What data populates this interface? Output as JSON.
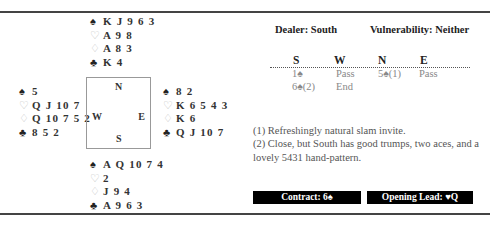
{
  "hands": {
    "north": {
      "spades": "K J 9 6 3",
      "hearts": "A 9 8",
      "diamonds": "A 8 3",
      "clubs": "K 4"
    },
    "west": {
      "spades": "5",
      "hearts": "Q J 10 7",
      "diamonds": "Q 10 7 5 2",
      "clubs": "8 5 2"
    },
    "east": {
      "spades": "8 2",
      "hearts": "K 6 5 4 3",
      "diamonds": "K 6",
      "clubs": "Q J 10 7"
    },
    "south": {
      "spades": "A Q 10 7 4",
      "hearts": "2",
      "diamonds": "J 9 4",
      "clubs": "A 9 6 3"
    }
  },
  "suit_symbols": {
    "spades": "♠",
    "hearts": "♡",
    "diamonds": "♢",
    "clubs": "♣"
  },
  "compass": {
    "n": "N",
    "w": "W",
    "e": "E",
    "s": "S"
  },
  "meta": {
    "dealer": "Dealer: South",
    "vulnerability": "Vulnerability: Neither"
  },
  "auction": {
    "headers": [
      "S",
      "W",
      "N",
      "E"
    ],
    "rows": [
      [
        "1♠",
        "Pass",
        "5♠(1)",
        "Pass"
      ],
      [
        "6♠(2)",
        "End",
        "",
        ""
      ]
    ]
  },
  "notes": [
    "(1) Refreshingly natural slam invite.",
    "(2) Close, but South has good trumps, two aces, and a lovely 5431 hand-pattern."
  ],
  "summary": {
    "contract": "Contract: 6♠",
    "opening_lead": "Opening Lead: ♥Q"
  }
}
